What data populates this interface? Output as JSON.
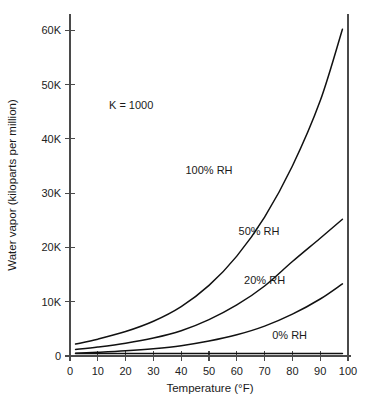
{
  "chart_data": {
    "type": "line",
    "title": "",
    "xlabel": "Temperature (°F)",
    "ylabel": "Water vapor (kiloparts per million)",
    "xlim": [
      0,
      100
    ],
    "ylim": [
      0,
      63000
    ],
    "xticks": [
      0,
      10,
      20,
      30,
      40,
      50,
      60,
      70,
      80,
      90,
      100
    ],
    "xticklabels": [
      "0",
      "10",
      "20",
      "30",
      "40",
      "50",
      "60",
      "70",
      "80",
      "90",
      "100"
    ],
    "yticks": [
      0,
      10000,
      20000,
      30000,
      40000,
      50000,
      60000
    ],
    "yticklabels": [
      "0",
      "10K",
      "20K",
      "30K",
      "40K",
      "50K",
      "60K"
    ],
    "grid": false,
    "legend_position": "inline-annotations",
    "annotations": [
      {
        "text": "K = 1000",
        "x": 22,
        "y": 45500
      },
      {
        "text": "100% RH",
        "x": 50,
        "y": 33500
      },
      {
        "text": "50% RH",
        "x": 68,
        "y": 22300
      },
      {
        "text": "20% RH",
        "x": 70,
        "y": 13200
      },
      {
        "text": "0% RH",
        "x": 79,
        "y": 3100
      }
    ],
    "x": [
      2,
      10,
      20,
      30,
      40,
      50,
      60,
      70,
      80,
      90,
      98
    ],
    "series": [
      {
        "name": "100% RH",
        "label": "100% RH",
        "color": "#111111",
        "values": [
          2200,
          3100,
          4500,
          6400,
          9100,
          13000,
          18400,
          25600,
          35000,
          47000,
          60200
        ]
      },
      {
        "name": "50% RH",
        "label": "50% RH",
        "color": "#111111",
        "values": [
          1200,
          1650,
          2350,
          3300,
          4650,
          6700,
          9400,
          12900,
          17400,
          21700,
          25200
        ]
      },
      {
        "name": "20% RH",
        "label": "20% RH",
        "color": "#111111",
        "values": [
          500,
          680,
          960,
          1350,
          1900,
          2750,
          3900,
          5500,
          7700,
          10500,
          13300
        ]
      },
      {
        "name": "0% RH",
        "label": "0% RH",
        "color": "#111111",
        "values": [
          450,
          450,
          450,
          450,
          450,
          450,
          450,
          450,
          450,
          450,
          450
        ]
      }
    ]
  },
  "figure": {
    "note": "K = 1000"
  }
}
